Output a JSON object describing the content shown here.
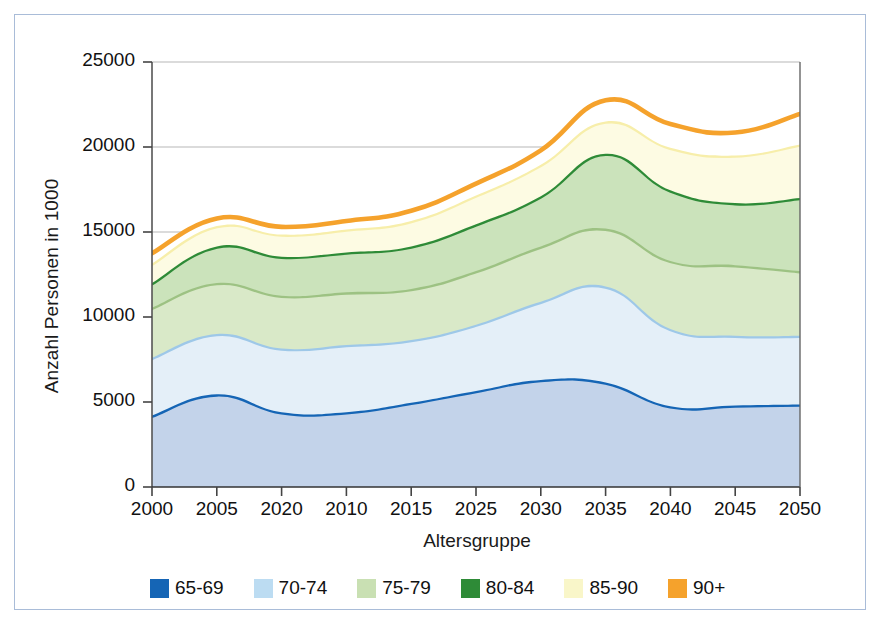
{
  "chart_data": {
    "type": "area",
    "stacked": true,
    "title": "",
    "xlabel": "Altersgruppe",
    "ylabel": "Anzahl Personen in 1000",
    "categories": [
      "2000",
      "2005",
      "2020",
      "2010",
      "2015",
      "2025",
      "2030",
      "2035",
      "2040",
      "2045",
      "2050"
    ],
    "xtick_labels": [
      "2000",
      "2005",
      "2020",
      "2010",
      "2015",
      "2025",
      "2030",
      "2035",
      "2040",
      "2045",
      "2050"
    ],
    "ytick_labels": [
      "0",
      "5000",
      "10000",
      "15000",
      "20000",
      "25000"
    ],
    "ytick_values": [
      0,
      5000,
      10000,
      15000,
      20000,
      25000
    ],
    "ylim": [
      0,
      25000
    ],
    "grid": "horizontal",
    "legend_position": "bottom",
    "series": [
      {
        "name": "65-69",
        "color": "#1565b5",
        "fill": "#c3d3ea",
        "values": [
          4200,
          5450,
          4400,
          4400,
          4950,
          5650,
          6300,
          6150,
          4750,
          4800,
          4850
        ]
      },
      {
        "name": "70-74",
        "color": "#9ec8e8",
        "fill": "#e4eff8",
        "values": [
          3400,
          3550,
          3750,
          3950,
          3700,
          3900,
          4600,
          5650,
          4550,
          4100,
          4050
        ]
      },
      {
        "name": "75-79",
        "color": "#9dc283",
        "fill": "#d9e9c8",
        "values": [
          2950,
          3000,
          3100,
          3100,
          3000,
          3150,
          3250,
          3400,
          4000,
          4150,
          3800
        ]
      },
      {
        "name": "80-84",
        "color": "#2e8b37",
        "fill": "#cbe3bb",
        "values": [
          1450,
          2150,
          2300,
          2350,
          2500,
          2750,
          2950,
          4400,
          4150,
          3650,
          4300
        ]
      },
      {
        "name": "85-90",
        "color": "#f7eeaa",
        "fill": "#fdfbe3",
        "values": [
          1150,
          1200,
          1300,
          1350,
          1500,
          1700,
          1850,
          1900,
          2500,
          2800,
          3150
        ]
      },
      {
        "name": "90+",
        "color": "#f5a22c",
        "fill": "#ffffff",
        "values": [
          600,
          450,
          450,
          500,
          600,
          700,
          850,
          1250,
          1400,
          1350,
          1800
        ]
      }
    ],
    "cumulative_totals": [
      13750,
      15800,
      15300,
      15650,
      16250,
      17850,
      19800,
      22750,
      21350,
      20850,
      21950
    ]
  },
  "legend": {
    "items": [
      {
        "label": "65-69",
        "color": "#1565b5"
      },
      {
        "label": "70-74",
        "color": "#bcdcf2"
      },
      {
        "label": "75-79",
        "color": "#c9e0b3"
      },
      {
        "label": "80-84",
        "color": "#2e8b37"
      },
      {
        "label": "85-90",
        "color": "#f9f6c9"
      },
      {
        "label": "90+",
        "color": "#f5a22c"
      }
    ]
  },
  "axes": {
    "x_title": "Altersgruppe",
    "y_title": "Anzahl Personen in 1000"
  }
}
